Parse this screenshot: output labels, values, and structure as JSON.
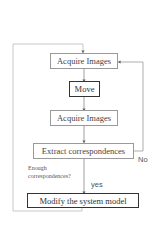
{
  "diagram": {
    "type": "flowchart",
    "nodes": [
      {
        "id": "acquire1",
        "label": "Acquire Images",
        "emphasis": false
      },
      {
        "id": "move",
        "label": "Move",
        "emphasis": true
      },
      {
        "id": "acquire2",
        "label": "Acquire Images",
        "emphasis": false
      },
      {
        "id": "extract",
        "label": "Extract correspondences",
        "emphasis": false
      },
      {
        "id": "modify",
        "label": "Modify the system model",
        "emphasis": true
      }
    ],
    "decision": {
      "question_line1": "Enough",
      "question_line2": "correspondences?",
      "yes_label": "yes",
      "no_label": "No"
    },
    "edges": [
      {
        "from": "acquire1",
        "to": "move"
      },
      {
        "from": "move",
        "to": "acquire2"
      },
      {
        "from": "acquire2",
        "to": "extract"
      },
      {
        "from": "extract",
        "to": "modify",
        "label": "yes"
      },
      {
        "from": "extract",
        "to": "acquire1",
        "label": "No"
      },
      {
        "from": "modify",
        "to": "acquire1"
      }
    ],
    "colors": {
      "line": "#9a9a9a",
      "strong_border": "#333333",
      "background": "#ffffff"
    }
  }
}
